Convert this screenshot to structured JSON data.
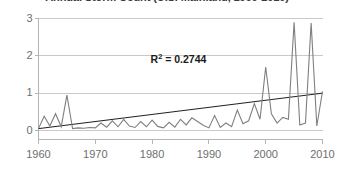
{
  "chart_data": {
    "type": "line",
    "title": "Annual Storm Count (U.S. Mainland, 1960-2010)",
    "xlabel": "",
    "ylabel": "",
    "xlim": [
      1960,
      2010
    ],
    "ylim": [
      0,
      3
    ],
    "grid": true,
    "legend_position": "none",
    "y_ticks": [
      "0",
      "1",
      "2",
      "3"
    ],
    "y_tick_values": [
      0,
      1,
      2,
      3
    ],
    "x_ticks": [
      "1960",
      "1970",
      "1980",
      "1990",
      "2000",
      "2010"
    ],
    "x_tick_values": [
      1960,
      1970,
      1980,
      1990,
      2000,
      2010
    ],
    "annotations": [
      {
        "name": "r-squared",
        "prefix": "R",
        "superscript": "2",
        "suffix": " = 0.2744",
        "text": "R² = 0.2744",
        "value": 0.2744,
        "x": 1988,
        "y": 1.9
      }
    ],
    "series": [
      {
        "name": "Annual count",
        "color": "#7f7f7f",
        "x": [
          1960,
          1961,
          1962,
          1963,
          1964,
          1965,
          1966,
          1967,
          1968,
          1969,
          1970,
          1971,
          1972,
          1973,
          1974,
          1975,
          1976,
          1977,
          1978,
          1979,
          1980,
          1981,
          1982,
          1983,
          1984,
          1985,
          1986,
          1987,
          1988,
          1989,
          1990,
          1991,
          1992,
          1993,
          1994,
          1995,
          1996,
          1997,
          1998,
          1999,
          2000,
          2001,
          2002,
          2003,
          2004,
          2005,
          2006,
          2007,
          2008,
          2009,
          2010
        ],
        "values": [
          0.05,
          0.38,
          0.12,
          0.45,
          0.1,
          0.95,
          0.05,
          0.07,
          0.06,
          0.08,
          0.07,
          0.2,
          0.09,
          0.26,
          0.1,
          0.3,
          0.12,
          0.08,
          0.24,
          0.1,
          0.28,
          0.11,
          0.07,
          0.22,
          0.09,
          0.3,
          0.15,
          0.34,
          0.24,
          0.14,
          0.07,
          0.4,
          0.08,
          0.2,
          0.1,
          0.55,
          0.18,
          0.26,
          0.72,
          0.3,
          1.7,
          0.45,
          0.2,
          0.35,
          0.3,
          2.9,
          0.15,
          0.2,
          2.88,
          0.12,
          1.05
        ]
      },
      {
        "name": "Linear trend",
        "color": "#1f1f1f",
        "type": "trendline",
        "x": [
          1960,
          2010
        ],
        "values": [
          0.05,
          1.0
        ]
      }
    ]
  }
}
